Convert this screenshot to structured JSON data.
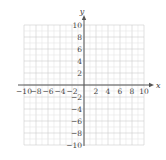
{
  "chart_data": {
    "type": "scatter",
    "title": "",
    "xlabel": "x",
    "ylabel": "y",
    "xlim": [
      -10,
      10
    ],
    "ylim": [
      -10,
      10
    ],
    "grid": true,
    "grid_step": 1,
    "x_ticks": [
      -10,
      -8,
      -6,
      -4,
      -2,
      2,
      4,
      6,
      8,
      10
    ],
    "y_ticks": [
      -10,
      -8,
      -6,
      -4,
      -2,
      2,
      4,
      6,
      8,
      10
    ],
    "x_tick_labels": [
      "−10",
      "−8",
      "−6",
      "−4",
      "−2",
      "2",
      "4",
      "6",
      "8",
      "10"
    ],
    "y_tick_labels": [
      "−10",
      "−8",
      "−6",
      "−4",
      "−2",
      "2",
      "4",
      "6",
      "8",
      "10"
    ],
    "series": [],
    "legend": null
  },
  "colors": {
    "grid_minor": "#e6e6e6",
    "grid_major": "#cfcfcf",
    "axis": "#555555",
    "text": "#444444"
  }
}
